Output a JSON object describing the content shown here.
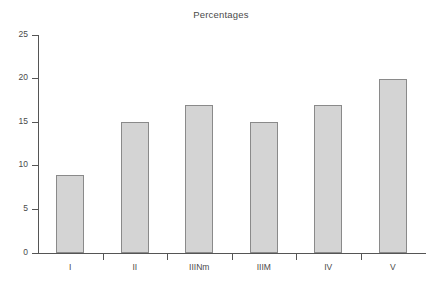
{
  "chart_data": {
    "type": "bar",
    "title": "Percentages",
    "xlabel": "",
    "ylabel": "",
    "categories": [
      "I",
      "II",
      "IIINm",
      "IIIM",
      "IV",
      "V"
    ],
    "values": [
      9,
      15,
      17,
      15,
      17,
      20
    ],
    "ylim": [
      0,
      25
    ],
    "yticks": [
      0,
      5,
      10,
      15,
      20,
      25
    ],
    "ytick_labels": [
      "0",
      "5",
      "10",
      "15",
      "20",
      "25"
    ],
    "grid": false,
    "legend": false,
    "bar_fill_color": "#d4d4d4",
    "bar_edge_color": "#8a8a8a",
    "axis_color": "#555555",
    "background_color": "#ffffff",
    "text_color": "#4a4a4a"
  }
}
